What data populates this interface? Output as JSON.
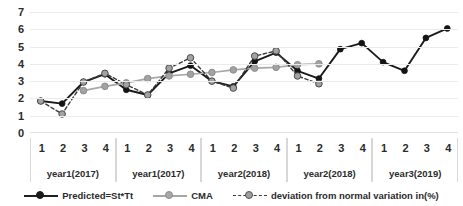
{
  "chart_data": {
    "type": "line",
    "title": "",
    "xlabel": "",
    "ylabel": "",
    "ylim": [
      0,
      7
    ],
    "yticks": [
      0,
      1,
      2,
      3,
      4,
      5,
      6,
      7
    ],
    "grid": true,
    "legend_position": "bottom",
    "categories": [
      "1",
      "2",
      "3",
      "4",
      "1",
      "2",
      "3",
      "4",
      "1",
      "2",
      "3",
      "4",
      "1",
      "2",
      "3",
      "4",
      "1",
      "2",
      "3",
      "4"
    ],
    "category_groups": [
      {
        "label": "year1(2017)",
        "ticks": [
          "1",
          "2",
          "3",
          "4"
        ]
      },
      {
        "label": "year1(2017)",
        "ticks": [
          "1",
          "2",
          "3",
          "4"
        ]
      },
      {
        "label": "year2(2018)",
        "ticks": [
          "1",
          "2",
          "3",
          "4"
        ]
      },
      {
        "label": "year2(2018)",
        "ticks": [
          "1",
          "2",
          "3",
          "4"
        ]
      },
      {
        "label": "year3(2019)",
        "ticks": [
          "1",
          "2",
          "3",
          "4"
        ]
      }
    ],
    "series": [
      {
        "name": "Predicted=St*Tt",
        "color": "#1a1a1a",
        "style": "solid",
        "marker": "filled-circle",
        "values": [
          1.85,
          1.7,
          2.95,
          3.4,
          2.5,
          2.2,
          3.45,
          3.9,
          3.0,
          2.7,
          4.15,
          4.65,
          3.6,
          3.15,
          4.85,
          5.2,
          4.1,
          3.6,
          5.5,
          6.05
        ]
      },
      {
        "name": "CMA",
        "color": "#a8a8a8",
        "style": "solid",
        "marker": "gray-circle",
        "values": [
          null,
          null,
          2.45,
          2.7,
          2.9,
          3.15,
          3.3,
          3.4,
          3.5,
          3.65,
          3.75,
          3.8,
          3.95,
          4.0,
          null,
          null,
          null,
          null,
          null,
          null
        ]
      },
      {
        "name": "deviation from normal variation in(%)",
        "color": "#3a3a3a",
        "style": "dashed",
        "marker": "gray-circle",
        "values": [
          1.85,
          1.1,
          2.95,
          3.45,
          2.8,
          2.2,
          3.75,
          4.35,
          3.0,
          2.6,
          4.45,
          4.75,
          3.3,
          2.85,
          null,
          null,
          null,
          null,
          null,
          null
        ]
      }
    ]
  },
  "legend": {
    "items": [
      {
        "label": "Predicted=St*Tt"
      },
      {
        "label": "CMA"
      },
      {
        "label": "deviation from normal variation in(%)"
      }
    ]
  }
}
